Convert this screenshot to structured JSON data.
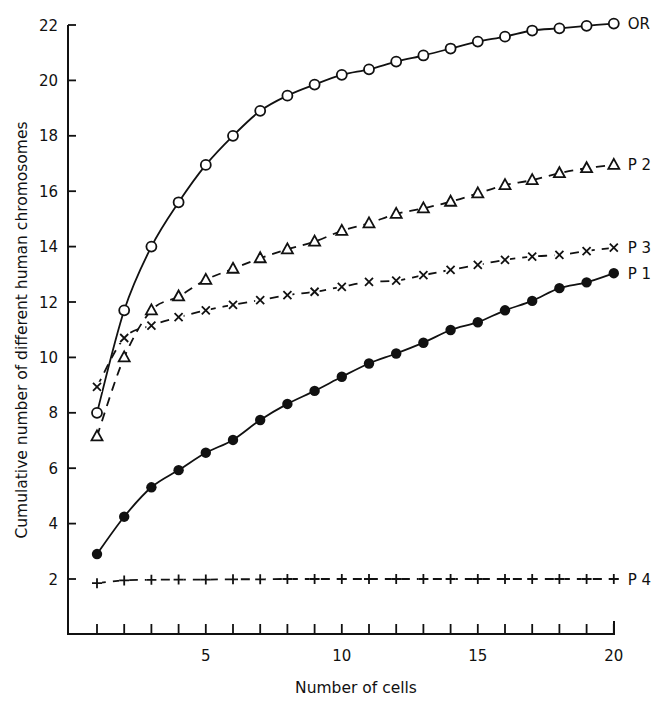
{
  "chart_data": {
    "type": "line",
    "title": "",
    "xlabel": "Number of cells",
    "ylabel": "Cumulative number of different human chromosomes",
    "xlim": [
      0,
      20
    ],
    "ylim": [
      0,
      22
    ],
    "x_ticks": [
      5,
      10,
      15,
      20
    ],
    "x_minor_ticks": [
      1,
      2,
      3,
      4,
      5,
      6,
      7,
      8,
      9,
      10,
      11,
      12,
      13,
      14,
      15,
      16,
      17,
      18,
      19,
      20
    ],
    "y_ticks": [
      2,
      4,
      6,
      8,
      10,
      12,
      14,
      16,
      18,
      20,
      22
    ],
    "grid": false,
    "legend_position": "inline-right",
    "x": [
      1,
      2,
      3,
      4,
      5,
      6,
      7,
      8,
      9,
      10,
      11,
      12,
      13,
      14,
      15,
      16,
      17,
      18,
      19,
      20
    ],
    "series": [
      {
        "name": "OR",
        "marker": "open-circle",
        "line_style": "solid",
        "values": [
          8.0,
          11.7,
          14.0,
          15.6,
          16.95,
          18.0,
          18.9,
          19.45,
          19.85,
          20.2,
          20.4,
          20.68,
          20.9,
          21.15,
          21.4,
          21.58,
          21.8,
          21.88,
          21.97,
          22.05
        ]
      },
      {
        "name": "P 2",
        "marker": "open-triangle",
        "line_style": "dashed",
        "values": [
          7.15,
          10.0,
          11.7,
          12.2,
          12.8,
          13.2,
          13.58,
          13.9,
          14.18,
          14.57,
          14.84,
          15.18,
          15.38,
          15.62,
          15.92,
          16.22,
          16.4,
          16.65,
          16.83,
          16.95
        ]
      },
      {
        "name": "P 3",
        "marker": "cross-x",
        "line_style": "dashed",
        "values": [
          8.94,
          10.7,
          11.15,
          11.45,
          11.7,
          11.9,
          12.07,
          12.25,
          12.37,
          12.55,
          12.73,
          12.77,
          12.97,
          13.16,
          13.34,
          13.52,
          13.64,
          13.7,
          13.84,
          13.96
        ]
      },
      {
        "name": "P 1",
        "marker": "filled-circle",
        "line_style": "solid",
        "values": [
          2.9,
          4.25,
          5.31,
          5.93,
          6.56,
          7.02,
          7.74,
          8.32,
          8.79,
          9.3,
          9.78,
          10.14,
          10.53,
          10.99,
          11.27,
          11.7,
          12.04,
          12.5,
          12.71,
          13.04
        ]
      },
      {
        "name": "P 4",
        "marker": "plus",
        "line_style": "dashed",
        "values": [
          1.85,
          1.95,
          1.97,
          1.98,
          1.98,
          1.99,
          1.99,
          2.0,
          2.0,
          2.0,
          2.0,
          2.0,
          2.0,
          2.0,
          2.0,
          2.0,
          2.0,
          2.0,
          2.0,
          2.0
        ]
      }
    ]
  },
  "labels": {
    "xlabel": "Number of cells",
    "ylabel": "Cumulative number of different human chromosomes",
    "series": [
      "OR",
      "P 2",
      "P 3",
      "P 1",
      "P 4"
    ]
  },
  "colors": {
    "ink": "#111111",
    "background": "#ffffff"
  }
}
